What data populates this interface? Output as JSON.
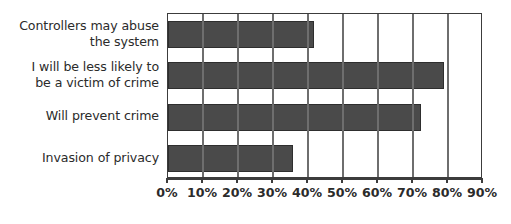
{
  "chart_data": {
    "type": "bar",
    "orientation": "horizontal",
    "title": "",
    "subtitle": "",
    "xlabel": "",
    "ylabel": "",
    "categories": [
      "Controllers may abuse\nthe system",
      "I will be less likely to\nbe a victim of crime",
      "Will prevent crime",
      "Invasion of privacy"
    ],
    "values": [
      41.7,
      78.9,
      72.3,
      35.7
    ],
    "value_unit": "%",
    "xlim": [
      0,
      90
    ],
    "x_tick_labels": [
      "0%",
      "10%",
      "20%",
      "30%",
      "40%",
      "50%",
      "60%",
      "70%",
      "80%",
      "90%"
    ],
    "x_tick_values": [
      0,
      10,
      20,
      30,
      40,
      50,
      60,
      70,
      80,
      90
    ],
    "grid": "vertical",
    "legend": "none",
    "series": [
      {
        "name": "",
        "values": [
          41.7,
          78.9,
          72.3,
          35.7
        ]
      }
    ],
    "colors": {
      "bar_fill": "#4a4a4a",
      "bar_border": "#2e2e2e",
      "gridline": "#6e6e6e",
      "frame": "#3c3c3c",
      "text": "#2b2b2b",
      "background": "#ffffff"
    }
  }
}
